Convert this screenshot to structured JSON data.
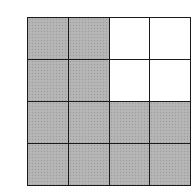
{
  "diagram": {
    "type": "shaded-grid",
    "rows": 4,
    "columns": 4,
    "colors": {
      "shaded": "#b3b3b3",
      "empty": "#ffffff",
      "line": "#1a1a1a"
    },
    "cells": [
      [
        1,
        1,
        0,
        0
      ],
      [
        1,
        1,
        0,
        0
      ],
      [
        1,
        1,
        1,
        1
      ],
      [
        1,
        1,
        1,
        1
      ]
    ],
    "shaded_count": 12,
    "total_count": 16
  }
}
